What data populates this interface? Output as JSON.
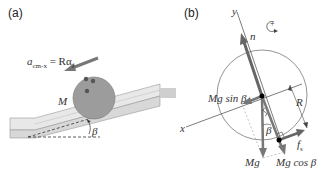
{
  "panel_a": {
    "label": "(a)",
    "accel_lhs": "a",
    "accel_sub": "cm-x",
    "accel_eq": " = Rα",
    "accel_eq_sub": "z",
    "mass_label": "M",
    "angle_label": "β"
  },
  "panel_b": {
    "label": "(b)",
    "axis_y": "y",
    "axis_x": "x",
    "normal_label": "n",
    "rotation_sign": "+",
    "gravity_parallel": "Mg sin β",
    "gravity": "Mg",
    "gravity_perp": "Mg cos β",
    "radius_label": "R",
    "friction_label": "f",
    "friction_sub": "s",
    "angle_label": "β"
  },
  "colors": {
    "ball_fill": "#9a9a9a",
    "ramp_fill": "#e6e6e6",
    "arrow": "#6b6b6b",
    "line": "#555555"
  }
}
